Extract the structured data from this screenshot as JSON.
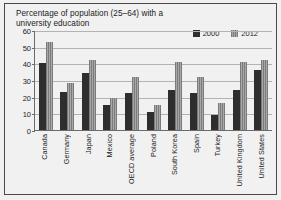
{
  "chart_data": {
    "type": "bar",
    "title": "Percentage of population (25–64) with a university education",
    "xlabel": "",
    "ylabel": "",
    "ylim": [
      0,
      60
    ],
    "yticks": [
      0,
      10,
      20,
      30,
      40,
      50,
      60
    ],
    "grid": true,
    "legend_position": "top-right",
    "categories": [
      "Canada",
      "Germany",
      "Japan",
      "Mexico",
      "OECD average",
      "Poland",
      "South Korea",
      "Spain",
      "Turkey",
      "United Kingdom",
      "United States"
    ],
    "series": [
      {
        "name": "2000",
        "color": "#2e2e2e",
        "values": [
          40,
          23,
          34,
          15,
          22,
          11,
          24,
          22,
          9,
          24,
          36
        ]
      },
      {
        "name": "2012",
        "color": "#8d8d8d",
        "values": [
          53,
          28,
          42,
          19,
          32,
          15,
          41,
          32,
          16,
          41,
          42
        ]
      }
    ]
  },
  "legend": {
    "items": [
      {
        "label": "2000",
        "swatch": "legend-swatch-2000"
      },
      {
        "label": "2012",
        "swatch": "legend-swatch-2012"
      }
    ]
  }
}
